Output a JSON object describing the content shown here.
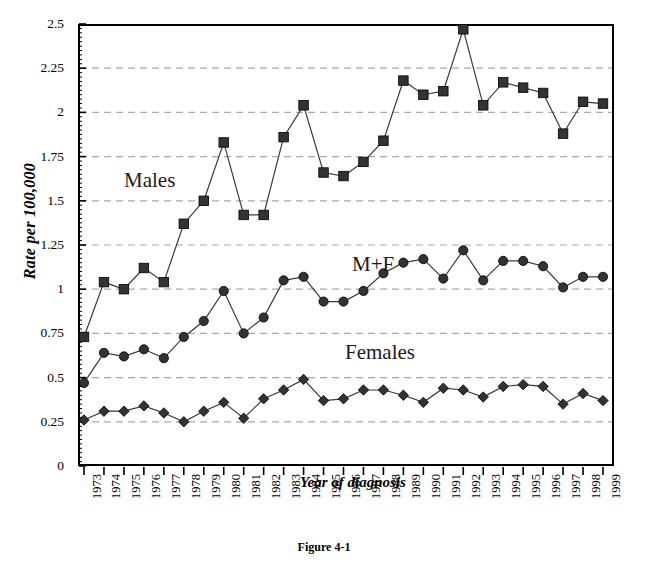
{
  "figure": {
    "caption": "Figure 4-1"
  },
  "chart_data": {
    "type": "line",
    "title": "",
    "xlabel": "Year of diagnosis",
    "ylabel": "Rate per 100,000",
    "ylim": [
      0,
      2.5
    ],
    "yticks": [
      "0",
      "0.25",
      "0.5",
      "0.75",
      "1",
      "1.25",
      "1.5",
      "1.75",
      "2",
      "2.25",
      "2.5"
    ],
    "ytick_values": [
      0,
      0.25,
      0.5,
      0.75,
      1,
      1.25,
      1.5,
      1.75,
      2,
      2.25,
      2.5
    ],
    "grid": "horizontal-dashed",
    "legend_position": "inline-annotations",
    "categories": [
      "1973",
      "1974",
      "1975",
      "1976",
      "1977",
      "1978",
      "1979",
      "1980",
      "1981",
      "1982",
      "1983",
      "1984",
      "1985",
      "1986",
      "1987",
      "1988",
      "1989",
      "1990",
      "1991",
      "1992",
      "1993",
      "1994",
      "1995",
      "1996",
      "1997",
      "1998",
      "1999"
    ],
    "series": [
      {
        "name": "Males",
        "marker": "square",
        "values": [
          0.73,
          1.04,
          1.0,
          1.12,
          1.04,
          1.37,
          1.5,
          1.83,
          1.42,
          1.42,
          1.86,
          2.04,
          1.66,
          1.64,
          1.72,
          1.84,
          2.18,
          2.1,
          2.12,
          2.47,
          2.04,
          2.17,
          2.14,
          2.11,
          1.88,
          2.06,
          2.05
        ]
      },
      {
        "name": "M+F",
        "marker": "circle",
        "values": [
          0.47,
          0.64,
          0.62,
          0.66,
          0.61,
          0.73,
          0.82,
          0.99,
          0.75,
          0.84,
          1.05,
          1.07,
          0.93,
          0.93,
          0.99,
          1.09,
          1.15,
          1.17,
          1.06,
          1.22,
          1.05,
          1.16,
          1.16,
          1.13,
          1.01,
          1.07,
          1.07
        ]
      },
      {
        "name": "Females",
        "marker": "diamond",
        "values": [
          0.26,
          0.31,
          0.31,
          0.34,
          0.3,
          0.25,
          0.31,
          0.36,
          0.27,
          0.38,
          0.43,
          0.49,
          0.37,
          0.38,
          0.43,
          0.43,
          0.4,
          0.36,
          0.44,
          0.43,
          0.39,
          0.45,
          0.46,
          0.45,
          0.35,
          0.41,
          0.37
        ]
      }
    ],
    "annotations": [
      {
        "text": "Males",
        "series": "Males"
      },
      {
        "text": "M+F",
        "series": "M+F"
      },
      {
        "text": "Females",
        "series": "Females"
      }
    ]
  }
}
